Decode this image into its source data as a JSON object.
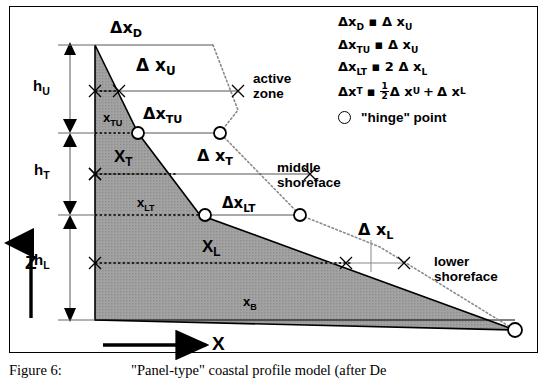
{
  "figure": {
    "caption_number": "Figure 6:",
    "caption_text": "\"Panel-type\" coastal profile model (after De"
  },
  "axes": {
    "z_label": "Z",
    "x_label": "X"
  },
  "depth_labels": [
    {
      "name": "h_U",
      "base": "h",
      "sub": "U"
    },
    {
      "name": "h_T",
      "base": "h",
      "sub": "T"
    },
    {
      "name": "h_L",
      "base": "h",
      "sub": "L"
    }
  ],
  "volume_labels": [
    {
      "name": "x_TU",
      "base": "x",
      "sub": "TU"
    },
    {
      "name": "x_T",
      "base": "X",
      "sub": "T"
    },
    {
      "name": "x_LT",
      "base": "x",
      "sub": "LT"
    },
    {
      "name": "x_L",
      "base": "X",
      "sub": "L"
    },
    {
      "name": "x_B",
      "base": "x",
      "sub": "B"
    }
  ],
  "displacement_labels": [
    {
      "name": "dx_D",
      "delta": "Δ",
      "base": "x",
      "sub": "D"
    },
    {
      "name": "dx_U",
      "delta": "Δ",
      "base": "x",
      "sub": "U"
    },
    {
      "name": "dx_TU",
      "delta": "Δ",
      "base": "x",
      "sub": "TU"
    },
    {
      "name": "dx_T",
      "delta": "Δ",
      "base": "x",
      "sub": "T"
    },
    {
      "name": "dx_LT",
      "delta": "Δ",
      "base": "x",
      "sub": "LT"
    },
    {
      "name": "dx_L",
      "delta": "Δ",
      "base": "x",
      "sub": "L"
    }
  ],
  "zones": [
    {
      "name": "active-zone",
      "line1": "active",
      "line2": "zone"
    },
    {
      "name": "middle-shoreface",
      "line1": "middle",
      "line2": "shoreface"
    },
    {
      "name": "lower-shoreface",
      "line1": "lower",
      "line2": "shoreface"
    }
  ],
  "legend": {
    "equations": [
      {
        "lhs_delta": "Δ",
        "lhs_base": "x",
        "lhs_sub": "D",
        "op": "▪",
        "rhs": "Δ x",
        "rhs_sub": "U"
      },
      {
        "lhs_delta": "Δ",
        "lhs_base": "x",
        "lhs_sub": "TU",
        "op": "▪",
        "rhs": "Δ x",
        "rhs_sub": "U"
      },
      {
        "lhs_delta": "Δ",
        "lhs_base": "x",
        "lhs_sub": "LT",
        "op": "▪",
        "rhs": "2 Δ x",
        "rhs_sub": "L"
      }
    ],
    "equation_fraction": {
      "lhs_delta": "Δ",
      "lhs_base": "x",
      "lhs_sub": "T",
      "op": "▪",
      "num": "1",
      "den": "2",
      "term1": "Δ x",
      "term1_sub": "U",
      "plus": "+",
      "term2": "Δ x",
      "term2_sub": "L"
    },
    "hinge_label": "\"hinge\" point",
    "hinge_marker": "hinge-circle-icon"
  },
  "colors": {
    "profile_fill": "#9d9d9d",
    "line": "#000000",
    "dotted": "#7a7a7a",
    "frame": "#000000",
    "background": "#ffffff"
  },
  "geometry": {
    "profile_polygon": "95,45 95,320 515,330 200,215 138,133",
    "levels": {
      "top": 45,
      "hU_hT": 133,
      "hT_hL": 215,
      "bottom": 320
    },
    "hinge_points": [
      {
        "name": "hinge-tu-left",
        "x": 138,
        "y": 133
      },
      {
        "name": "hinge-tu-right",
        "x": 220,
        "y": 133
      },
      {
        "name": "hinge-lt-left",
        "x": 205,
        "y": 215
      },
      {
        "name": "hinge-lt-right",
        "x": 300,
        "y": 215
      },
      {
        "name": "hinge-base",
        "x": 515,
        "y": 330
      }
    ]
  }
}
